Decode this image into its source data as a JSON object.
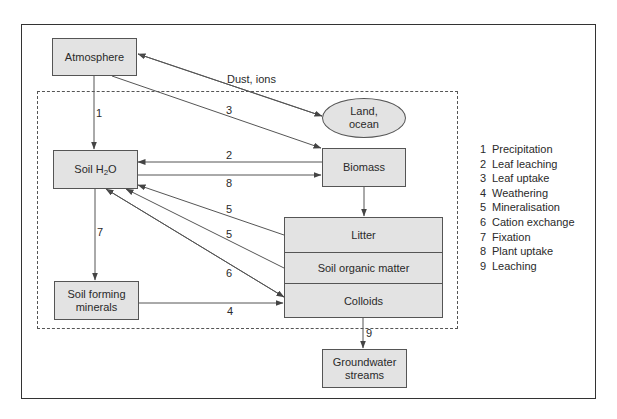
{
  "diagram": {
    "nodes": {
      "atmosphere": "Atmosphere",
      "soil_h2o_prefix": "Soil H",
      "soil_h2o_sub": "2",
      "soil_h2o_suffix": "O",
      "land_ocean_line1": "Land,",
      "land_ocean_line2": "ocean",
      "biomass": "Biomass",
      "litter": "Litter",
      "soil_organic_matter": "Soil organic matter",
      "colloids": "Colloids",
      "soil_forming_minerals_line1": "Soil forming",
      "soil_forming_minerals_line2": "minerals",
      "groundwater_line1": "Groundwater",
      "groundwater_line2": "streams"
    },
    "edge_labels": {
      "dust_ions": "Dust, ions",
      "e1": "1",
      "e3": "3",
      "e2": "2",
      "e8": "8",
      "e5a": "5",
      "e5b": "5",
      "e6": "6",
      "e7": "7",
      "e4": "4",
      "e9": "9"
    },
    "edges": [
      {
        "from": "Atmosphere",
        "to": "Soil H2O",
        "label": "1"
      },
      {
        "from": "Atmosphere",
        "to": "Biomass",
        "label": "3"
      },
      {
        "from": "Land, ocean",
        "to": "Atmosphere",
        "label": "Dust, ions",
        "bidirectional": true
      },
      {
        "from": "Biomass",
        "to": "Soil H2O",
        "label": "2"
      },
      {
        "from": "Soil H2O",
        "to": "Biomass",
        "label": "8"
      },
      {
        "from": "Biomass",
        "to": "Litter",
        "label": ""
      },
      {
        "from": "Litter",
        "to": "Soil H2O",
        "label": "5"
      },
      {
        "from": "Soil organic matter",
        "to": "Soil H2O",
        "label": "5"
      },
      {
        "from": "Colloids",
        "to": "Soil H2O",
        "label": "6",
        "bidirectional": true
      },
      {
        "from": "Soil H2O",
        "to": "Soil forming minerals",
        "label": "7"
      },
      {
        "from": "Soil forming minerals",
        "to": "Colloids",
        "label": "4"
      },
      {
        "from": "Colloids",
        "to": "Groundwater streams",
        "label": "9"
      }
    ]
  },
  "legend": [
    {
      "num": "1",
      "text": "Precipitation"
    },
    {
      "num": "2",
      "text": "Leaf leaching"
    },
    {
      "num": "3",
      "text": "Leaf uptake"
    },
    {
      "num": "4",
      "text": "Weathering"
    },
    {
      "num": "5",
      "text": "Mineralisation"
    },
    {
      "num": "6",
      "text": "Cation exchange"
    },
    {
      "num": "7",
      "text": "Fixation"
    },
    {
      "num": "8",
      "text": "Plant uptake"
    },
    {
      "num": "9",
      "text": "Leaching"
    }
  ],
  "colors": {
    "node_fill": "#e3e3e3",
    "stroke": "#555555",
    "text": "#2a2a2a"
  }
}
